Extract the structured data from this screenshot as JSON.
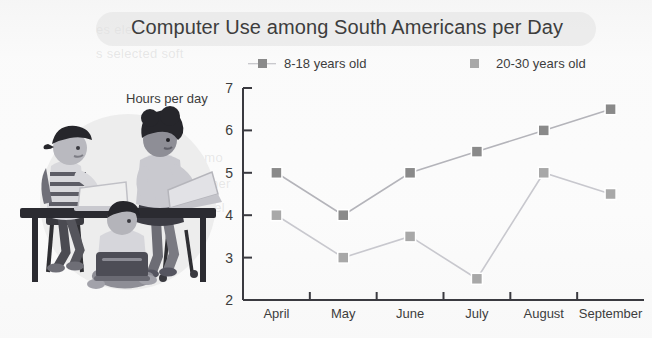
{
  "chart_data": {
    "type": "line",
    "title": "Computer Use among South Americans per Day",
    "xlabel": "",
    "ylabel": "Hours per day",
    "categories": [
      "April",
      "May",
      "June",
      "July",
      "August",
      "September"
    ],
    "series": [
      {
        "name": "8-18 years old",
        "values": [
          5,
          4,
          5,
          5.5,
          6,
          6.5
        ],
        "color": "#8a8a8a",
        "marker": "square"
      },
      {
        "name": "20-30 years old",
        "values": [
          4,
          3,
          3.5,
          2.5,
          5,
          4.5
        ],
        "color": "#a8a8a8",
        "marker": "square"
      }
    ],
    "ylim": [
      2,
      7
    ],
    "yticks": [
      2,
      3,
      4,
      5,
      6,
      7
    ],
    "ytick_labels": [
      "2",
      "3",
      "4",
      "5",
      "6",
      "7"
    ],
    "grid": false,
    "legend_position": "top"
  },
  "header": {
    "title": "Computer Use among South Americans per Day"
  },
  "legend": {
    "items": [
      {
        "label": "8-18 years old"
      },
      {
        "label": "20-30 years old"
      }
    ]
  },
  "axes": {
    "y_label": "Hours per day"
  },
  "illustration": {
    "name": "three-people-using-laptops-at-desk",
    "alt": "Illustration of three young people using laptops at a desk"
  },
  "background_artifacts": {
    "line1": "es ele de",
    "line2": "s selected soft",
    "line3": "como",
    "line4": "poner",
    "line5": "es el"
  }
}
